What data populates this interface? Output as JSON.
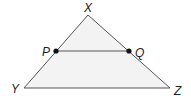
{
  "diagram": {
    "type": "triangle-with-midsegment",
    "colors": {
      "fill": "#f3f3f3",
      "stroke": "#555555",
      "point": "#111111",
      "label": "#222222"
    },
    "vertices": [
      {
        "name": "X",
        "label": "X"
      },
      {
        "name": "Y",
        "label": "Y"
      },
      {
        "name": "Z",
        "label": "Z"
      }
    ],
    "points": [
      {
        "name": "P",
        "label": "P",
        "on_segment": "XY"
      },
      {
        "name": "Q",
        "label": "Q",
        "on_segment": "XZ"
      }
    ],
    "segments": [
      "XY",
      "YZ",
      "XZ",
      "PQ"
    ]
  }
}
